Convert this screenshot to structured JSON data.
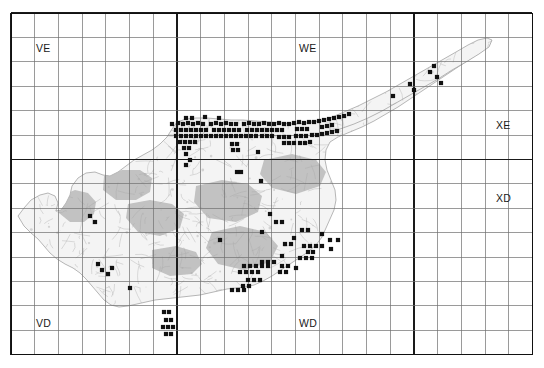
{
  "figure": {
    "kind": "species-distribution-map",
    "region": "Cyprus"
  },
  "grid": {
    "columns": 22,
    "rows": 14,
    "cell_width_px": 23.7,
    "cell_height_px": 24.4,
    "origin_x_px": 11,
    "origin_y_px": 13,
    "thin_line_color": "#6f6f6f",
    "thick_line_color": "#1a1a1a",
    "border_color": "#111111",
    "major_column_indices": [
      7,
      17
    ],
    "major_row_indices": [
      6
    ]
  },
  "labels": [
    {
      "id": "VE",
      "text": "VE",
      "x": 36,
      "y": 43
    },
    {
      "id": "WE",
      "text": "WE",
      "x": 299,
      "y": 43
    },
    {
      "id": "XE",
      "text": "XE",
      "x": 496,
      "y": 120
    },
    {
      "id": "XD",
      "text": "XD",
      "x": 496,
      "y": 193
    },
    {
      "id": "VD",
      "text": "VD",
      "x": 36,
      "y": 318
    },
    {
      "id": "WD",
      "text": "WD",
      "x": 299,
      "y": 318
    }
  ],
  "map": {
    "land_fill": "#f4f4f4",
    "land_stroke": "#9a9a9a",
    "shade_fill": "#b9b9b9",
    "texture_stroke": "#a8a8a8",
    "outline": "M 18,216 L 24,208 L 31,200 L 40,195 L 48,193 L 55,196 L 58,203 L 56,211 L 61,210 L 66,203 L 70,195 L 72,186 L 78,178 L 86,173 L 95,172 L 103,175 L 110,176 L 118,172 L 126,166 L 134,160 L 143,155 L 152,150 L 160,144 L 167,137 L 172,129 L 177,122 L 186,119 L 196,118 L 207,118 L 219,119 L 231,120 L 243,120 L 256,121 L 268,122 L 281,123 L 294,124 L 306,123 L 318,121 L 330,118 L 342,115 L 354,111 L 366,106 L 378,100 L 390,93 L 402,86 L 414,79 L 426,72 L 438,65 L 450,58 L 462,51 L 473,45 L 481,41 L 487,39 L 491,41 L 489,46 L 481,52 L 470,59 L 458,67 L 446,75 L 434,83 L 422,91 L 410,99 L 398,107 L 386,114 L 374,121 L 362,127 L 350,132 L 338,137 L 330,142 L 326,150 L 325,160 L 327,170 L 331,180 L 335,190 L 336,200 L 334,210 L 330,219 L 326,228 L 322,237 L 316,245 L 308,252 L 299,258 L 290,264 L 281,270 L 272,276 L 263,281 L 254,285 L 245,287 L 236,288 L 227,289 L 218,291 L 209,293 L 200,295 L 191,296 L 182,297 L 173,298 L 164,299 L 155,300 L 146,302 L 137,304 L 128,306 L 119,307 L 111,305 L 104,300 L 98,293 L 92,286 L 86,279 L 80,273 L 73,268 L 65,264 L 57,259 L 50,253 L 44,246 L 38,239 L 31,233 L 24,226 Z",
    "panhandle": "M 330,118 L 344,112 L 358,106 L 372,99 L 386,92 L 400,84 L 414,76 L 428,68 L 442,60 L 456,52 L 468,45 L 478,40 L 487,38 L 492,40 L 489,47 L 479,54 L 466,62 L 452,70 L 438,79 L 424,87 L 410,95 L 396,103 L 382,111 L 368,118 L 354,124 L 340,129 L 330,132 Z",
    "shaded_regions": [
      "M 60,196 L 75,190 L 88,193 L 96,202 L 94,214 L 84,222 L 70,222 L 59,213 Z",
      "M 104,176 L 122,170 L 140,170 L 152,178 L 150,192 L 136,200 L 116,200 L 103,190 Z",
      "M 128,204 L 150,200 L 172,204 L 184,214 L 180,228 L 160,236 L 138,232 L 126,218 Z",
      "M 196,186 L 222,180 L 248,184 L 262,196 L 258,212 L 236,222 L 208,218 L 194,202 Z",
      "M 212,232 L 240,226 L 266,232 L 278,246 L 270,262 L 244,270 L 218,264 L 206,248 Z",
      "M 264,160 L 292,154 L 316,160 L 326,172 L 320,186 L 296,194 L 272,188 L 260,174 Z",
      "M 152,250 L 176,246 L 196,252 L 202,264 L 192,274 L 170,276 L 152,268 Z"
    ]
  },
  "occurrences": {
    "marker_shape": "filled-square",
    "marker_color": "#111111",
    "marker_size_px": 4.2,
    "count": 178,
    "points": [
      [
        172,
        124
      ],
      [
        178,
        123
      ],
      [
        183,
        124
      ],
      [
        188,
        123
      ],
      [
        193,
        124
      ],
      [
        198,
        123
      ],
      [
        203,
        124
      ],
      [
        176,
        130
      ],
      [
        181,
        130
      ],
      [
        186,
        130
      ],
      [
        191,
        130
      ],
      [
        196,
        130
      ],
      [
        201,
        130
      ],
      [
        206,
        130
      ],
      [
        211,
        124
      ],
      [
        216,
        123
      ],
      [
        221,
        124
      ],
      [
        226,
        123
      ],
      [
        231,
        124
      ],
      [
        236,
        124
      ],
      [
        214,
        130
      ],
      [
        219,
        130
      ],
      [
        224,
        130
      ],
      [
        229,
        130
      ],
      [
        234,
        130
      ],
      [
        239,
        130
      ],
      [
        244,
        124
      ],
      [
        249,
        123
      ],
      [
        254,
        124
      ],
      [
        259,
        124
      ],
      [
        264,
        123
      ],
      [
        269,
        124
      ],
      [
        247,
        130
      ],
      [
        252,
        130
      ],
      [
        257,
        130
      ],
      [
        262,
        130
      ],
      [
        267,
        130
      ],
      [
        274,
        124
      ],
      [
        279,
        123
      ],
      [
        284,
        124
      ],
      [
        289,
        124
      ],
      [
        272,
        130
      ],
      [
        277,
        130
      ],
      [
        282,
        130
      ],
      [
        294,
        123
      ],
      [
        299,
        122
      ],
      [
        304,
        123
      ],
      [
        309,
        122
      ],
      [
        314,
        122
      ],
      [
        297,
        129
      ],
      [
        302,
        129
      ],
      [
        307,
        129
      ],
      [
        319,
        121
      ],
      [
        324,
        120
      ],
      [
        329,
        119
      ],
      [
        334,
        118
      ],
      [
        339,
        117
      ],
      [
        322,
        127
      ],
      [
        327,
        126
      ],
      [
        332,
        125
      ],
      [
        186,
        118
      ],
      [
        192,
        118
      ],
      [
        205,
        117
      ],
      [
        219,
        118
      ],
      [
        344,
        116
      ],
      [
        349,
        114
      ],
      [
        176,
        136
      ],
      [
        181,
        136
      ],
      [
        186,
        136
      ],
      [
        191,
        136
      ],
      [
        196,
        136
      ],
      [
        201,
        136
      ],
      [
        206,
        136
      ],
      [
        211,
        136
      ],
      [
        216,
        136
      ],
      [
        221,
        136
      ],
      [
        180,
        142
      ],
      [
        185,
        142
      ],
      [
        190,
        142
      ],
      [
        195,
        142
      ],
      [
        226,
        136
      ],
      [
        231,
        136
      ],
      [
        236,
        136
      ],
      [
        241,
        136
      ],
      [
        246,
        136
      ],
      [
        251,
        136
      ],
      [
        256,
        136
      ],
      [
        262,
        136
      ],
      [
        267,
        136
      ],
      [
        272,
        136
      ],
      [
        279,
        137
      ],
      [
        284,
        137
      ],
      [
        289,
        137
      ],
      [
        296,
        136
      ],
      [
        301,
        136
      ],
      [
        306,
        136
      ],
      [
        312,
        135
      ],
      [
        317,
        135
      ],
      [
        322,
        134
      ],
      [
        327,
        133
      ],
      [
        332,
        132
      ],
      [
        337,
        131
      ],
      [
        284,
        143
      ],
      [
        289,
        143
      ],
      [
        294,
        143
      ],
      [
        300,
        143
      ],
      [
        305,
        143
      ],
      [
        310,
        142
      ],
      [
        184,
        148
      ],
      [
        189,
        148
      ],
      [
        186,
        154
      ],
      [
        190,
        160
      ],
      [
        186,
        165
      ],
      [
        232,
        144
      ],
      [
        237,
        144
      ],
      [
        233,
        150
      ],
      [
        238,
        150
      ],
      [
        258,
        152
      ],
      [
        237,
        172
      ],
      [
        241,
        172
      ],
      [
        261,
        181
      ],
      [
        430,
        72
      ],
      [
        434,
        66
      ],
      [
        437,
        77
      ],
      [
        441,
        83
      ],
      [
        410,
        84
      ],
      [
        414,
        90
      ],
      [
        393,
        96
      ],
      [
        330,
        240
      ],
      [
        338,
        240
      ],
      [
        285,
        244
      ],
      [
        291,
        244
      ],
      [
        294,
        238
      ],
      [
        304,
        246
      ],
      [
        310,
        246
      ],
      [
        316,
        246
      ],
      [
        322,
        246
      ],
      [
        331,
        249
      ],
      [
        308,
        252
      ],
      [
        313,
        252
      ],
      [
        300,
        258
      ],
      [
        306,
        258
      ],
      [
        312,
        258
      ],
      [
        262,
        262
      ],
      [
        268,
        262
      ],
      [
        274,
        262
      ],
      [
        244,
        266
      ],
      [
        250,
        266
      ],
      [
        256,
        266
      ],
      [
        262,
        266
      ],
      [
        268,
        266
      ],
      [
        240,
        272
      ],
      [
        246,
        272
      ],
      [
        252,
        272
      ],
      [
        258,
        272
      ],
      [
        282,
        266
      ],
      [
        288,
        266
      ],
      [
        280,
        272
      ],
      [
        286,
        272
      ],
      [
        248,
        280
      ],
      [
        254,
        280
      ],
      [
        260,
        280
      ],
      [
        243,
        286
      ],
      [
        249,
        286
      ],
      [
        282,
        256
      ],
      [
        232,
        290
      ],
      [
        238,
        290
      ],
      [
        244,
        290
      ],
      [
        262,
        232
      ],
      [
        220,
        240
      ],
      [
        164,
        312
      ],
      [
        169,
        312
      ],
      [
        166,
        320
      ],
      [
        171,
        320
      ],
      [
        163,
        327
      ],
      [
        168,
        327
      ],
      [
        173,
        327
      ],
      [
        166,
        334
      ],
      [
        171,
        334
      ],
      [
        90,
        216
      ],
      [
        95,
        222
      ],
      [
        108,
        274
      ],
      [
        112,
        268
      ],
      [
        130,
        288
      ],
      [
        98,
        264
      ],
      [
        102,
        270
      ],
      [
        302,
        230
      ],
      [
        308,
        230
      ],
      [
        322,
        234
      ],
      [
        276,
        222
      ],
      [
        282,
        222
      ],
      [
        270,
        214
      ],
      [
        296,
        268
      ]
    ]
  }
}
